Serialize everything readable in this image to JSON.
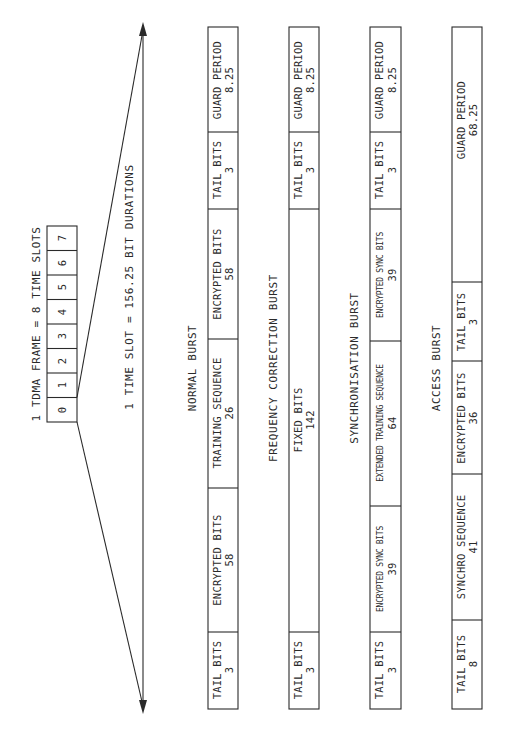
{
  "frame": {
    "title": "1 TDMA FRAME = 8 TIME SLOTS",
    "slots": [
      "0",
      "1",
      "2",
      "3",
      "4",
      "5",
      "6",
      "7"
    ]
  },
  "time_slot": {
    "label": "1 TIME SLOT = 156.25 BIT DURATIONS"
  },
  "bursts": [
    {
      "name": "NORMAL BURST",
      "fields": [
        {
          "label": "TAIL BITS",
          "bits": "3"
        },
        {
          "label": "ENCRYPTED BITS",
          "bits": "58"
        },
        {
          "label": "TRAINING SEQUENCE",
          "bits": "26"
        },
        {
          "label": "ENCRYPTED BITS",
          "bits": "58"
        },
        {
          "label": "TAIL BITS",
          "bits": "3"
        },
        {
          "label": "GUARD PERIOD",
          "bits": "8.25"
        }
      ]
    },
    {
      "name": "FREQUENCY CORRECTION BURST",
      "fields": [
        {
          "label": "TAIL BITS",
          "bits": "3"
        },
        {
          "label": "FIXED BITS",
          "bits": "142"
        },
        {
          "label": "TAIL BITS",
          "bits": "3"
        },
        {
          "label": "GUARD PERIOD",
          "bits": "8.25"
        }
      ]
    },
    {
      "name": "SYNCHRONISATION BURST",
      "fields": [
        {
          "label": "TAIL BITS",
          "bits": "3"
        },
        {
          "label": "ENCRYPTED SYNC BITS",
          "bits": "39"
        },
        {
          "label": "EXTENDED TRAINING SEQUENCE",
          "bits": "64"
        },
        {
          "label": "ENCRYPTED SYNC BITS",
          "bits": "39"
        },
        {
          "label": "TAIL BITS",
          "bits": "3"
        },
        {
          "label": "GUARD PERIOD",
          "bits": "8.25"
        }
      ]
    },
    {
      "name": "ACCESS BURST",
      "fields": [
        {
          "label": "TAIL BITS",
          "bits": "8"
        },
        {
          "label": "SYNCHRO SEQUENCE",
          "bits": "41"
        },
        {
          "label": "ENCRYPTED BITS",
          "bits": "36"
        },
        {
          "label": "TAIL BITS",
          "bits": "3"
        },
        {
          "label": "GUARD PERIOD",
          "bits": "68.25"
        }
      ]
    }
  ],
  "colors": {
    "line": "#2a2a2a",
    "background": "#ffffff"
  }
}
